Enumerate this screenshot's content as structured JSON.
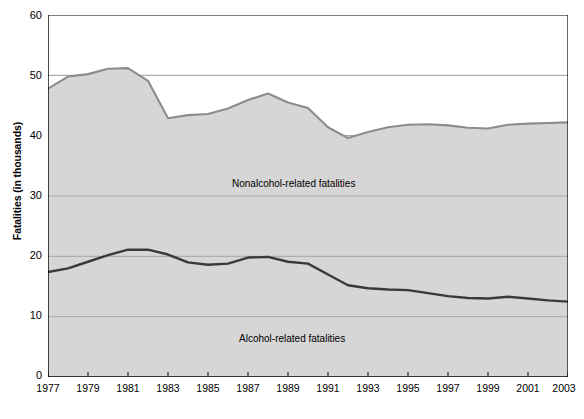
{
  "chart_data": {
    "type": "area",
    "title": "",
    "subtitle": "",
    "xlabel": "",
    "ylabel": "Fatalities (in thousands)",
    "ylim": [
      0,
      60
    ],
    "xlim": [
      1977,
      2003
    ],
    "yticks": [
      0,
      10,
      20,
      30,
      40,
      50,
      60
    ],
    "xticks": [
      1977,
      1979,
      1981,
      1983,
      1985,
      1987,
      1989,
      1991,
      1993,
      1995,
      1997,
      1999,
      2001,
      2003
    ],
    "xtick_labels": [
      "1977",
      "1979",
      "1981",
      "1983",
      "1985",
      "1987",
      "1989",
      "1991",
      "1993",
      "1995",
      "1997",
      "1999",
      "2001",
      "2003"
    ],
    "ytick_labels": [
      "0",
      "10",
      "20",
      "30",
      "40",
      "50",
      "60"
    ],
    "grid": "horizontal",
    "legend_position": "inline-annotations",
    "stacked": true,
    "x": [
      1977,
      1978,
      1979,
      1980,
      1981,
      1982,
      1983,
      1984,
      1985,
      1986,
      1987,
      1988,
      1989,
      1990,
      1991,
      1992,
      1993,
      1994,
      1995,
      1996,
      1997,
      1998,
      1999,
      2000,
      2001,
      2002,
      2003
    ],
    "series": [
      {
        "name": "Alcohol-related fatalities",
        "annotation": "Alcohol-related fatalities",
        "color": "#3a3a3a",
        "fill": "#d6d6d6",
        "values": [
          17.4,
          18.0,
          19.1,
          20.2,
          21.1,
          21.1,
          20.3,
          19.0,
          18.6,
          18.8,
          19.8,
          19.9,
          19.1,
          18.8,
          17.0,
          15.2,
          14.7,
          14.5,
          14.4,
          13.9,
          13.4,
          13.1,
          13.0,
          13.3,
          13.0,
          12.7,
          12.5
        ]
      },
      {
        "name": "Nonalcohol-related fatalities",
        "annotation": "Nonalcohol-related fatalities",
        "color": "#8c8c8c",
        "fill": "#d6d6d6",
        "values": [
          30.4,
          31.8,
          31.1,
          30.9,
          30.1,
          28.0,
          22.6,
          24.4,
          25.0,
          25.7,
          26.1,
          27.1,
          26.4,
          25.8,
          24.4,
          24.4,
          25.9,
          26.9,
          27.4,
          28.0,
          28.3,
          28.2,
          28.2,
          28.5,
          29.0,
          29.4,
          29.7
        ]
      }
    ],
    "total_series": {
      "name": "Total fatalities (stack top)",
      "color": "#8c8c8c",
      "values": [
        47.8,
        49.8,
        50.2,
        51.1,
        51.2,
        49.1,
        42.9,
        43.4,
        43.6,
        44.5,
        45.9,
        47.0,
        45.5,
        44.6,
        41.4,
        39.6,
        40.6,
        41.4,
        41.8,
        41.9,
        41.7,
        41.3,
        41.2,
        41.8,
        42.0,
        42.1,
        42.2
      ]
    }
  },
  "labels": {
    "y_axis_title": "Fatalities (in thousands)",
    "nonalcohol": "Nonalcohol-related fatalities",
    "alcohol": "Alcohol-related fatalities"
  },
  "colors": {
    "area_fill": "#d6d6d6",
    "total_line": "#8c8c8c",
    "alcohol_line": "#3a3a3a",
    "gridline": "#9a9a9a",
    "axis": "#000000",
    "background": "#ffffff"
  }
}
